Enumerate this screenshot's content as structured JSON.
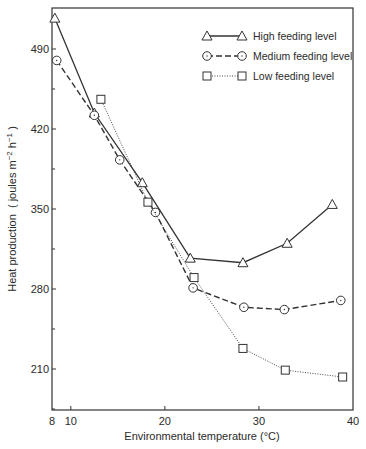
{
  "chart_data": {
    "type": "line",
    "title": "",
    "xlabel": "Environmental temperature (°C)",
    "ylabel": "Heat production ( joules m⁻² h⁻¹ )",
    "xlim": [
      8,
      40
    ],
    "ylim": [
      175,
      525
    ],
    "x_ticks": [
      8,
      10,
      20,
      30,
      40
    ],
    "y_ticks": [
      210,
      280,
      350,
      420,
      490
    ],
    "grid": false,
    "legend_position": "upper right",
    "series": [
      {
        "name": "High feeding level",
        "marker": "triangle",
        "line_style": "solid",
        "x": [
          8.3,
          12.5,
          17.6,
          22.7,
          28.3,
          33.0,
          37.8
        ],
        "values": [
          517,
          434,
          373,
          307,
          303,
          320,
          354
        ]
      },
      {
        "name": "Medium feeding level",
        "marker": "circle",
        "line_style": "dashed",
        "x": [
          8.5,
          12.5,
          15.2,
          19.0,
          23.0,
          28.4,
          32.7,
          38.7
        ],
        "values": [
          480,
          432,
          393,
          347,
          281,
          264,
          262,
          270
        ]
      },
      {
        "name": "Low feeding level",
        "marker": "square",
        "line_style": "dotted",
        "x": [
          13.2,
          18.2,
          23.1,
          28.3,
          32.8,
          38.9
        ],
        "values": [
          446,
          356,
          290,
          228,
          209,
          203
        ]
      }
    ]
  },
  "labels": {
    "xlabel": "Environmental temperature (°C)",
    "ylabel_main": "Heat production",
    "ylabel_units": "( joules m",
    "x_tick_labels": [
      "8",
      "10",
      "20",
      "30",
      "40"
    ],
    "y_tick_labels": [
      "210",
      "280",
      "350",
      "420",
      "490"
    ],
    "legend": [
      "High feeding level",
      "Medium feeding level",
      "Low feeding level"
    ]
  }
}
